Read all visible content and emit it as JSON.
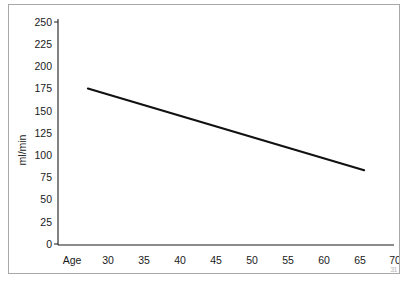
{
  "chart_data": {
    "type": "line",
    "title": "",
    "subtitle": "",
    "xlabel": "Age",
    "ylabel": "ml/min",
    "xlim": [
      25,
      72
    ],
    "ylim": [
      0,
      250
    ],
    "grid": false,
    "legend": null,
    "x_ticks": [
      30,
      35,
      40,
      45,
      50,
      55,
      60,
      65,
      70
    ],
    "x_tick_labels": [
      "30",
      "35",
      "40",
      "45",
      "50",
      "55",
      "60",
      "65",
      "70"
    ],
    "x_axis_prefix_label": "Age",
    "y_ticks": [
      0,
      25,
      50,
      75,
      100,
      125,
      150,
      175,
      200,
      225,
      250
    ],
    "y_tick_labels": [
      "0",
      "25",
      "50",
      "75",
      "100",
      "125",
      "150",
      "175",
      "200",
      "225",
      "250"
    ],
    "series": [
      {
        "name": "creatinine-clearance",
        "color": "#111111",
        "x": [
          27.2,
          65.7
        ],
        "values": [
          175,
          83
        ]
      }
    ],
    "annotations": []
  },
  "figure": {
    "border_color": "#a8a8a8",
    "background_color": "#ffffff",
    "axis_color": "#1a1a1a",
    "corner_mark": "31"
  }
}
